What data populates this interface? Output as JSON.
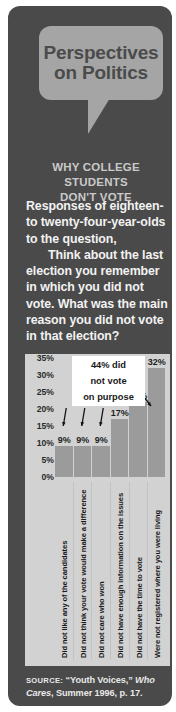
{
  "panel": {
    "title_lines": [
      "Perspectives",
      "on Politics"
    ],
    "subtitle_lines": [
      "WHY COLLEGE STUDENTS",
      "DON'T VOTE"
    ],
    "body_paragraph_1": "Responses of eighteen- to twenty-four-year-olds to the question,",
    "body_paragraph_2": "Think about the last election you remember in which you did not vote. What was the main reason you did not vote in that election?",
    "source_label": "SOURCE:",
    "source_text_1": " “Youth Voices,” ",
    "source_italic": "Who Cares",
    "source_text_2": ", Summer 1996, p. 17."
  },
  "colors": {
    "panel_bg": "#4a4a4a",
    "badge_bg": "#a5a5a5",
    "chart_bg": "#d2d2d2",
    "bar_fill": "#9b9b9b",
    "callout_bg": "#ffffff",
    "body_text": "#f2f2f2",
    "subtitle_text": "#c9c9c9"
  },
  "chart_data": {
    "type": "bar",
    "title": "WHY COLLEGE STUDENTS DON'T VOTE",
    "xlabel": "",
    "ylabel": "",
    "ylim": [
      0,
      35
    ],
    "grid": false,
    "legend": "none",
    "ytick_labels": [
      "35%",
      "30%",
      "25%",
      "20%",
      "15%",
      "10%",
      "5%",
      "0%"
    ],
    "ytick_values": [
      35,
      30,
      25,
      20,
      15,
      10,
      5,
      0
    ],
    "categories": [
      "Did not like any of the candidates",
      "Did not think your vote would make a difference",
      "Did not care who won",
      "Did not have enough information on the issues",
      "Did not have the time to vote",
      "Were not registered where you were living"
    ],
    "values": [
      9,
      9,
      9,
      17,
      22,
      32
    ],
    "value_labels": [
      "9%",
      "9%",
      "9%",
      "17%",
      "22%",
      "32%"
    ],
    "annotation_lines": [
      "44% did",
      "not vote",
      "on purpose"
    ],
    "annotation_targets": [
      0,
      1,
      2,
      3
    ]
  }
}
